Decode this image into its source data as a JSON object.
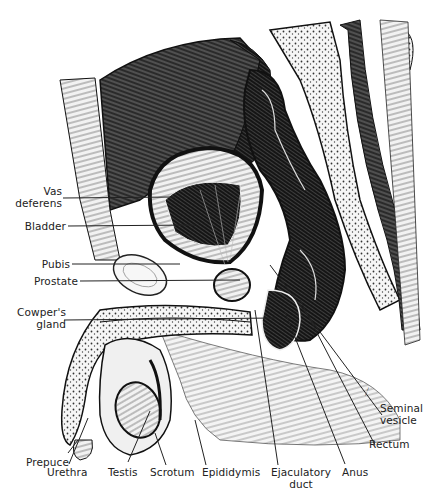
{
  "figure": {
    "style": "black-and-white line drawing",
    "colors": {
      "ink": "#1a1a1a",
      "paper": "#ffffff",
      "leader": "#222222"
    }
  },
  "labels": {
    "vas_deferens": {
      "line1": "Vas",
      "line2": "deferens"
    },
    "bladder": "Bladder",
    "pubis": "Pubis",
    "prostate": "Prostate",
    "cowpers_gland": {
      "line1": "Cowper's",
      "line2": "gland"
    },
    "prepuce": "Prepuce",
    "urethra": "Urethra",
    "testis": "Testis",
    "scrotum": "Scrotum",
    "epididymis": "Epididymis",
    "ejaculatory_duct": {
      "line1": "Ejaculatory",
      "line2": "duct"
    },
    "anus": "Anus",
    "rectum": "Rectum",
    "seminal_vesicle": {
      "line1": "Seminal",
      "line2": "vesicle"
    }
  }
}
